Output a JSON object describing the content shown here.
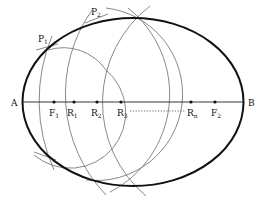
{
  "diagram": {
    "colors": {
      "ellipse": "#111111",
      "arcs": "#7a7a7a",
      "axis": "#222222",
      "text": "#111111"
    },
    "ellipse": {
      "cx": 133,
      "cy": 102,
      "rx": 110.5,
      "ry": 84
    },
    "axis": {
      "y": 102,
      "x1": 22,
      "x2": 243
    },
    "labels": {
      "A": "A",
      "B": "B",
      "F1": "F",
      "F1_sub": "1",
      "F2": "F",
      "F2_sub": "2",
      "R1": "R",
      "R1_sub": "1",
      "R2": "R",
      "R2_sub": "2",
      "R3": "R",
      "R3_sub": "3",
      "Rn": "R",
      "Rn_sub": "n",
      "P1": "P",
      "P1_sub": "1",
      "P2": "P",
      "P2_sub": "2"
    },
    "points": [
      {
        "id": "F1",
        "x": 54
      },
      {
        "id": "R1",
        "x": 74
      },
      {
        "id": "R2",
        "x": 97
      },
      {
        "id": "R3",
        "x": 121
      },
      {
        "id": "Rn",
        "x": 191
      },
      {
        "id": "F2",
        "x": 215
      }
    ],
    "dotted_segment": {
      "from": "R3",
      "to": "Rn"
    }
  }
}
